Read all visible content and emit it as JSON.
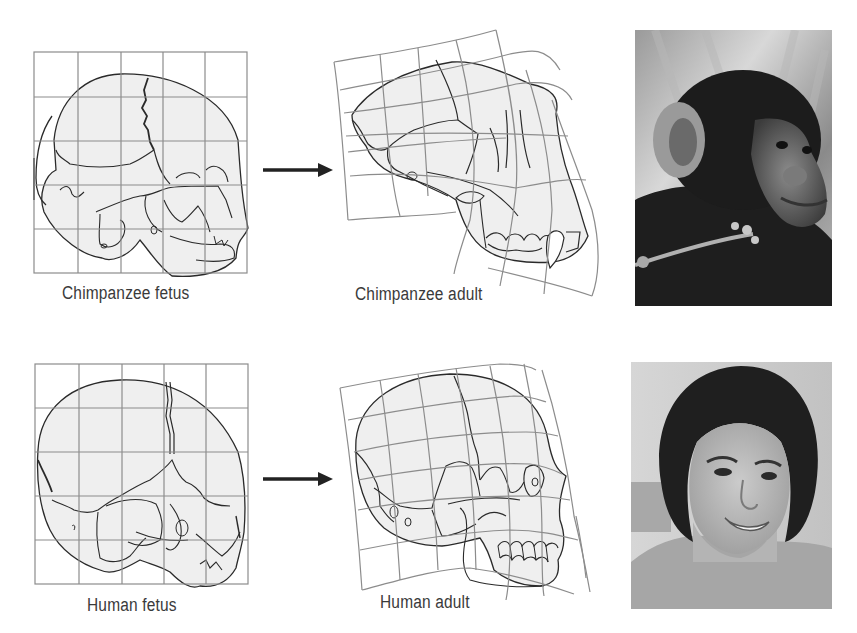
{
  "figure": {
    "rows": [
      {
        "id": "chimpanzee",
        "fetus_label": "Chimpanzee fetus",
        "adult_label": "Chimpanzee adult",
        "photo": "chimpanzee-photo"
      },
      {
        "id": "human",
        "fetus_label": "Human fetus",
        "adult_label": "Human adult",
        "photo": "human-photo"
      }
    ],
    "icons": {
      "transform_arrow": "arrow-right-icon"
    },
    "colors": {
      "grid_line": "#8c8c8c",
      "skull_outline": "#2a2a2a",
      "skull_fill": "#efefef",
      "label_text": "#3a3a3a",
      "arrow": "#222222"
    }
  }
}
